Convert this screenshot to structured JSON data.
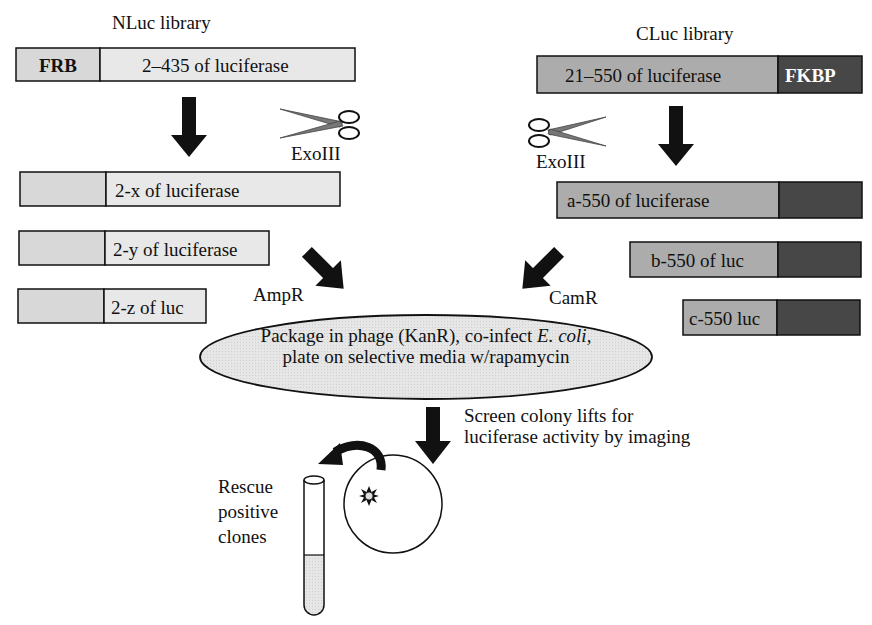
{
  "diagram": {
    "nluc": {
      "title": "NLuc library",
      "parent": {
        "tag": "FRB",
        "segment": "2–435 of luciferase"
      },
      "fragments": [
        "2-x of luciferase",
        "2-y of luciferase",
        "2-z of luc"
      ],
      "enzyme": "ExoIII",
      "marker": "AmpR"
    },
    "cluc": {
      "title": "CLuc library",
      "parent": {
        "segment": "21–550 of luciferase",
        "tag": "FKBP"
      },
      "fragments": [
        "a-550 of luciferase",
        "b-550 of luc",
        "c-550 luc"
      ],
      "enzyme": "ExoIII",
      "marker": "CamR"
    },
    "package_step": {
      "line1_prefix": "Package in phage (KanR), co-infect ",
      "line1_italic": "E. coli,",
      "line2": "plate on selective media w/rapamycin"
    },
    "screen_step": {
      "line1": "Screen colony lifts for",
      "line2": "luciferase activity by imaging"
    },
    "rescue_step": {
      "line1": "Rescue",
      "line2": "positive",
      "line3": "clones"
    },
    "colors": {
      "nluc_fill": "#e4e4e4",
      "frb_fill": "#d6d6d6",
      "cluc_fill": "#a9a9a9",
      "fkbp_fill": "#4a4a4a",
      "ellipse_fill": "#dcdcdc",
      "scissor_blade": "#7a7a7a",
      "arrow": "#111111"
    }
  }
}
